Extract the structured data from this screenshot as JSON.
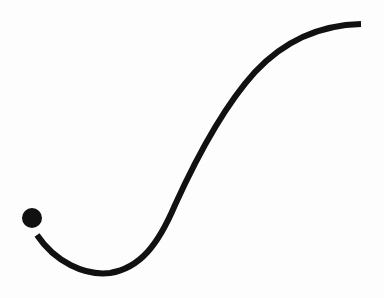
{
  "figure": {
    "description": "Single S-shaped stroke curve with a filled dot at its starting end",
    "stroke_color": "#111111",
    "background_color": "#fdfdfd",
    "dot": {
      "cx": 32,
      "cy": 218,
      "r": 10
    },
    "curve_path": "M 37 235 C 55 262, 85 276, 110 273 C 140 268, 158 245, 175 205 C 200 150, 225 105, 255 72 C 285 40, 320 25, 361 24",
    "stroke_width": 6
  }
}
